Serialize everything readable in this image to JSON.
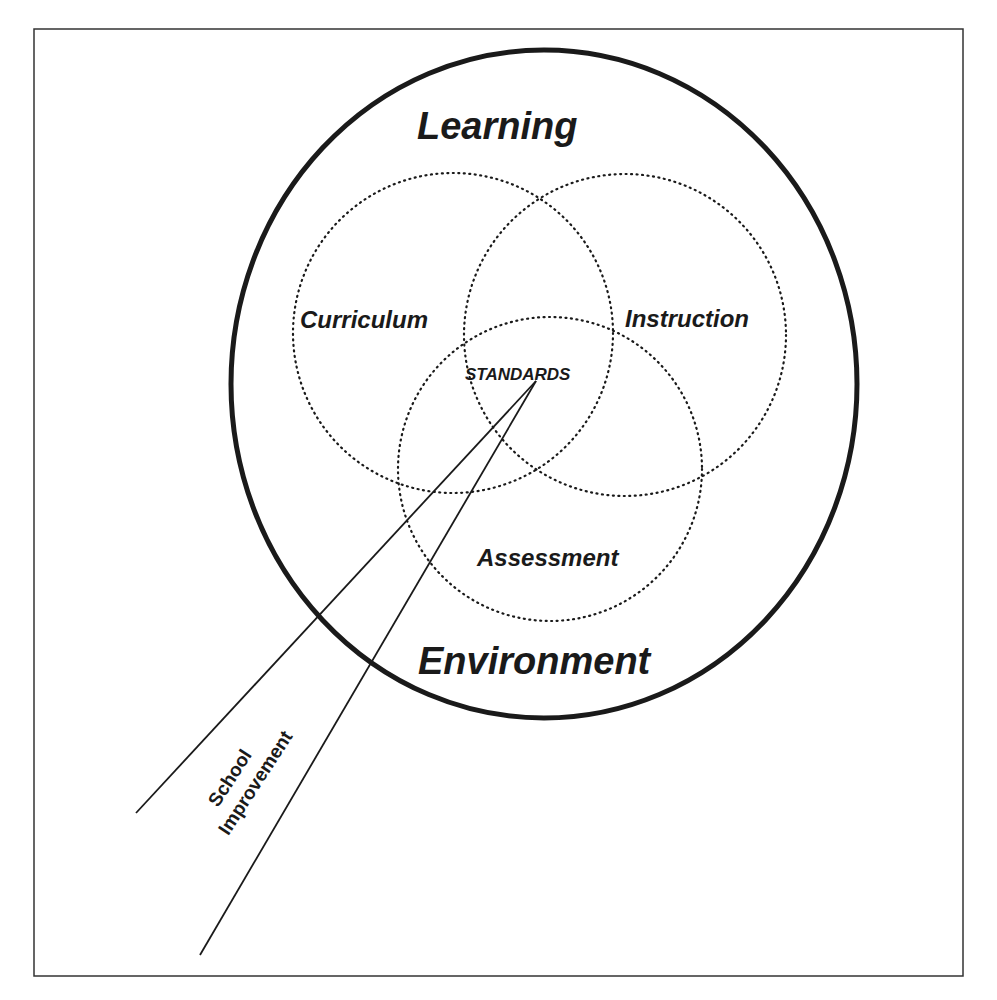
{
  "diagram": {
    "outer_label_top": "Learning",
    "outer_label_bottom": "Environment",
    "circles": [
      {
        "label": "Curriculum"
      },
      {
        "label": "Instruction"
      },
      {
        "label": "Assessment"
      }
    ],
    "center_label": "STANDARDS",
    "beam_label_line1": "School",
    "beam_label_line2": "Improvement"
  },
  "colors": {
    "stroke": "#1a1a1a",
    "background": "#ffffff"
  }
}
